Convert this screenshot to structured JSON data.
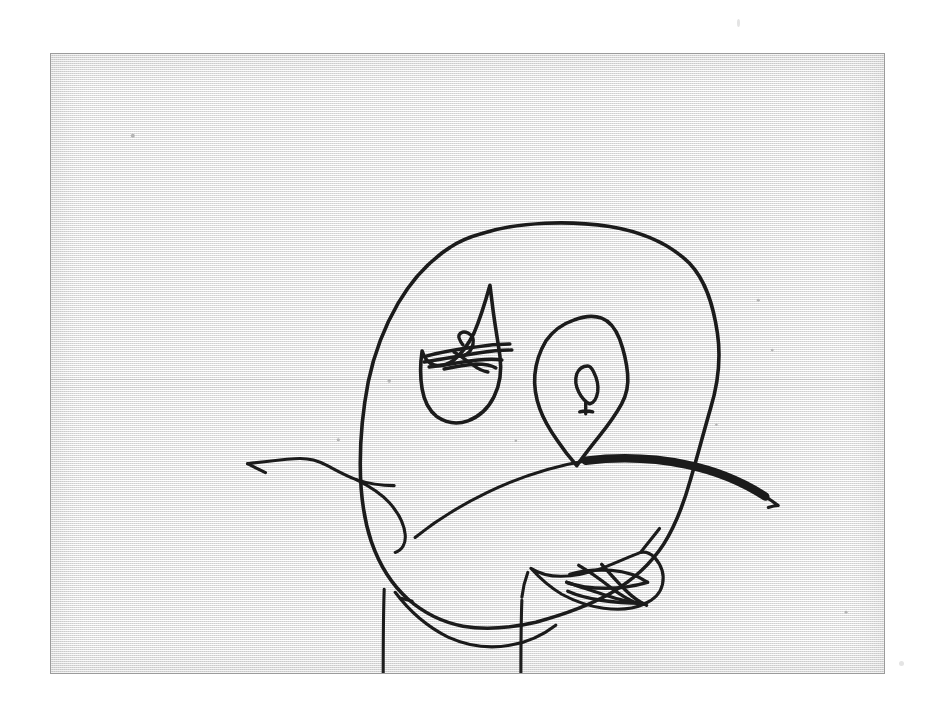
{
  "document": {
    "kind": "scanned-drawing",
    "medium": "pen on paper",
    "caption": "",
    "background_color": "#f1f1f1",
    "ink_color": "#1b1b1b",
    "border_color": "#9b9b9b",
    "canvas": {
      "width": 938,
      "height": 714
    },
    "sheet": {
      "x": 50,
      "y": 53,
      "width": 835,
      "height": 621
    }
  },
  "artwork": {
    "title": "Child-style line drawing of a sad face",
    "subject": "sad face",
    "strokes": [
      {
        "name": "head-outline",
        "label": "Head outline",
        "weight": "medium",
        "path": "M 432 180 C 470 168 520 167 560 173 C 596 179 622 192 640 210 C 657 228 664 253 668 280 C 672 307 668 333 661 356 C 654 380 648 404 641 427 C 634 452 626 473 614 492 C 601 512 583 528 561 541 C 538 554 512 563 486 570 C 460 576 435 578 413 574 C 392 570 374 561 358 547 C 341 532 329 512 321 489 C 313 465 310 438 310 411 C 310 383 313 355 318 329 C 324 300 334 274 348 250 C 362 226 380 207 400 194 C 410 187 421 183 432 180 Z"
      },
      {
        "name": "left-eye-outline",
        "label": "Left eye outline (teardrop)",
        "weight": "medium",
        "path": "M 440 232 C 435 250 430 266 424 280 C 418 292 411 301 404 307 C 397 312 390 314 384 312 C 378 310 374 305 372 298 C 370 311 370 324 372 336 C 374 348 379 358 387 364 C 396 370 407 372 418 368 C 429 364 438 356 444 344 C 450 332 452 318 450 303 C 448 288 445 272 443 256 C 442 248 441 240 440 232 Z"
      },
      {
        "name": "left-eye-pupil-loop",
        "label": "Left eye pupil loop",
        "weight": "scribble",
        "path": "M 413 292 C 410 288 408 285 409 282 C 410 279 414 278 418 280 C 422 282 424 286 423 291 C 422 296 419 300 415 302"
      },
      {
        "name": "left-eye-scribble-1",
        "label": "Left eye scribble stroke",
        "weight": "scribble",
        "path": "M 376 303 C 392 299 409 296 425 294 C 437 292 449 291 460 291"
      },
      {
        "name": "left-eye-scribble-2",
        "label": "Left eye scribble stroke",
        "weight": "scribble",
        "path": "M 374 309 C 392 306 410 303 428 300 C 441 298 452 297 462 297"
      },
      {
        "name": "left-eye-scribble-3",
        "label": "Left eye scribble stroke",
        "weight": "scribble",
        "path": "M 379 314 C 395 312 412 309 428 307 C 438 306 446 306 452 307"
      },
      {
        "name": "left-eye-scribble-4",
        "label": "Left eye scribble stroke",
        "weight": "scribble",
        "path": "M 394 316 C 404 314 415 312 426 311 C 434 311 441 312 446 315"
      },
      {
        "name": "left-eye-scribble-5",
        "label": "Left eye scribble stroke",
        "weight": "scribble",
        "path": "M 404 299 C 411 303 417 308 423 312 C 428 316 433 318 438 319"
      },
      {
        "name": "right-eye-outline",
        "label": "Right eye outline (diamond)",
        "weight": "medium",
        "path": "M 524 267 C 534 263 544 262 552 265 C 560 268 566 276 570 286 C 574 297 577 309 578 321 C 579 332 577 342 572 351 C 566 362 558 373 549 384 C 541 394 533 404 527 413 C 520 405 513 396 507 387 C 500 377 494 367 490 356 C 486 345 484 334 485 322 C 486 310 490 298 496 288 C 503 278 512 271 524 267 Z"
      },
      {
        "name": "right-eye-pupil",
        "label": "Right eye pupil",
        "weight": "scribble",
        "path": "M 538 313 C 533 313 529 316 527 321 C 525 327 526 333 529 339 C 532 345 536 349 540 351 C 544 350 547 345 548 339 C 549 332 547 325 544 319 C 542 315 540 313 538 313 Z M 536 349 C 536 354 536 358 536 361 M 530 359 C 534 358 539 358 543 359"
      },
      {
        "name": "mouth-frown",
        "label": "Mouth (downturned frown)",
        "weight": "thick",
        "path": "M 536 408 C 570 404 604 405 637 412 C 666 418 693 429 716 444"
      },
      {
        "name": "mouth-frown-left-tail",
        "label": "Mouth left tail (thin)",
        "weight": "thin",
        "path": "M 536 408 C 501 414 468 425 437 440 C 410 453 385 469 365 485"
      },
      {
        "name": "mouth-frown-right-tip",
        "label": "Mouth right tip",
        "weight": "thin",
        "path": "M 716 444 C 721 447 725 450 729 453 C 726 453 722 454 719 455"
      },
      {
        "name": "left-arm",
        "label": "Left arm line",
        "weight": "thin",
        "path": "M 197 411 C 213 409 229 407 244 406 C 256 405 266 407 275 412 C 285 417 295 423 306 427 C 318 431 331 433 344 433"
      },
      {
        "name": "left-arm-tip",
        "label": "Left arm tip flick",
        "weight": "thin",
        "path": "M 197 411 C 203 414 209 417 215 420"
      },
      {
        "name": "left-ear-loop",
        "label": "Left ear / cheek loop",
        "weight": "thin",
        "path": "M 306 427 C 318 433 330 440 339 450 C 348 460 354 471 355 482 C 356 491 352 498 345 500"
      },
      {
        "name": "hand-outline",
        "label": "Hand outline",
        "weight": "thin",
        "path": "M 591 500 C 578 505 565 511 552 516 C 538 521 524 524 511 524 C 499 524 489 521 481 516 C 490 526 500 535 512 542 C 525 549 539 554 554 556 C 569 558 583 557 594 552 C 604 548 611 541 613 532 C 615 523 612 513 605 505 C 601 501 596 499 591 500 Z"
      },
      {
        "name": "hand-wrist",
        "label": "Hand wrist line",
        "weight": "thin",
        "path": "M 591 500 C 597 492 604 484 610 476"
      },
      {
        "name": "hand-scribble-1",
        "label": "Hand finger scribble",
        "weight": "scribble",
        "path": "M 520 522 C 534 518 548 517 562 518 C 575 519 588 523 598 530"
      },
      {
        "name": "hand-scribble-2",
        "label": "Hand finger scribble",
        "weight": "scribble",
        "path": "M 598 530 C 584 534 570 536 556 536 C 542 536 528 534 517 530"
      },
      {
        "name": "hand-scribble-3",
        "label": "Hand finger scribble",
        "weight": "scribble",
        "path": "M 517 530 C 530 534 543 539 556 543 C 568 547 580 550 592 551"
      },
      {
        "name": "hand-scribble-4",
        "label": "Hand finger scribble",
        "weight": "scribble",
        "path": "M 592 551 C 578 551 564 550 551 548 C 538 546 527 543 518 539"
      },
      {
        "name": "hand-scribble-5",
        "label": "Hand finger scribble",
        "weight": "scribble",
        "path": "M 529 513 C 541 520 552 528 562 536 C 571 543 580 548 589 552"
      },
      {
        "name": "hand-scribble-6",
        "label": "Hand finger scribble",
        "weight": "scribble",
        "path": "M 552 512 C 560 521 568 530 576 538 C 583 545 590 550 597 553"
      },
      {
        "name": "chin-jaw",
        "label": "Chin / jaw curve",
        "weight": "thin",
        "path": "M 345 540 C 360 560 378 575 398 585 C 418 594 440 597 461 593 C 478 590 493 583 506 573"
      },
      {
        "name": "left-leg",
        "label": "Left leg",
        "weight": "thin",
        "path": "M 334 537 C 333 565 333 594 333 622 C 333 644 333 660 334 672"
      },
      {
        "name": "right-leg",
        "label": "Right leg",
        "weight": "thin",
        "path": "M 472 548 C 471 574 471 600 471 626 C 471 648 471 663 472 674"
      },
      {
        "name": "neck-right-line",
        "label": "Right shoulder / neck line",
        "weight": "thin",
        "path": "M 478 520 C 475 528 473 536 472 545"
      },
      {
        "name": "cheek-tick",
        "label": "Small cheek tick mark",
        "weight": "thin",
        "path": "M 351 546 C 355 547 359 548 362 549"
      }
    ],
    "specks": [
      {
        "name": "paper-speck",
        "cx": 82,
        "cy": 82,
        "r": 2.0
      },
      {
        "name": "paper-speck",
        "cx": 339,
        "cy": 328,
        "r": 1.8
      },
      {
        "name": "paper-speck",
        "cx": 288,
        "cy": 387,
        "r": 1.6
      },
      {
        "name": "paper-speck",
        "cx": 709,
        "cy": 247,
        "r": 1.5
      },
      {
        "name": "paper-speck",
        "cx": 723,
        "cy": 297,
        "r": 1.4
      },
      {
        "name": "paper-speck",
        "cx": 466,
        "cy": 388,
        "r": 1.3
      },
      {
        "name": "paper-speck",
        "cx": 667,
        "cy": 372,
        "r": 1.3
      },
      {
        "name": "paper-speck",
        "cx": 797,
        "cy": 560,
        "r": 1.5
      }
    ]
  }
}
